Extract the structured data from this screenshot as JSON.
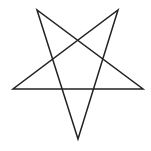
{
  "figure": {
    "shape": "inverted-pentagram",
    "stroke_color": "#222222",
    "background": "#ffffff",
    "stroke_width": 1.5,
    "vertices": {
      "top_left": [
        37,
        10
      ],
      "top_right": [
        118,
        10
      ],
      "right": [
        143,
        89
      ],
      "bottom": [
        78,
        139
      ],
      "left": [
        13,
        89
      ]
    },
    "path_points": "37,10 78,139 118,10 13,89 143,89"
  }
}
